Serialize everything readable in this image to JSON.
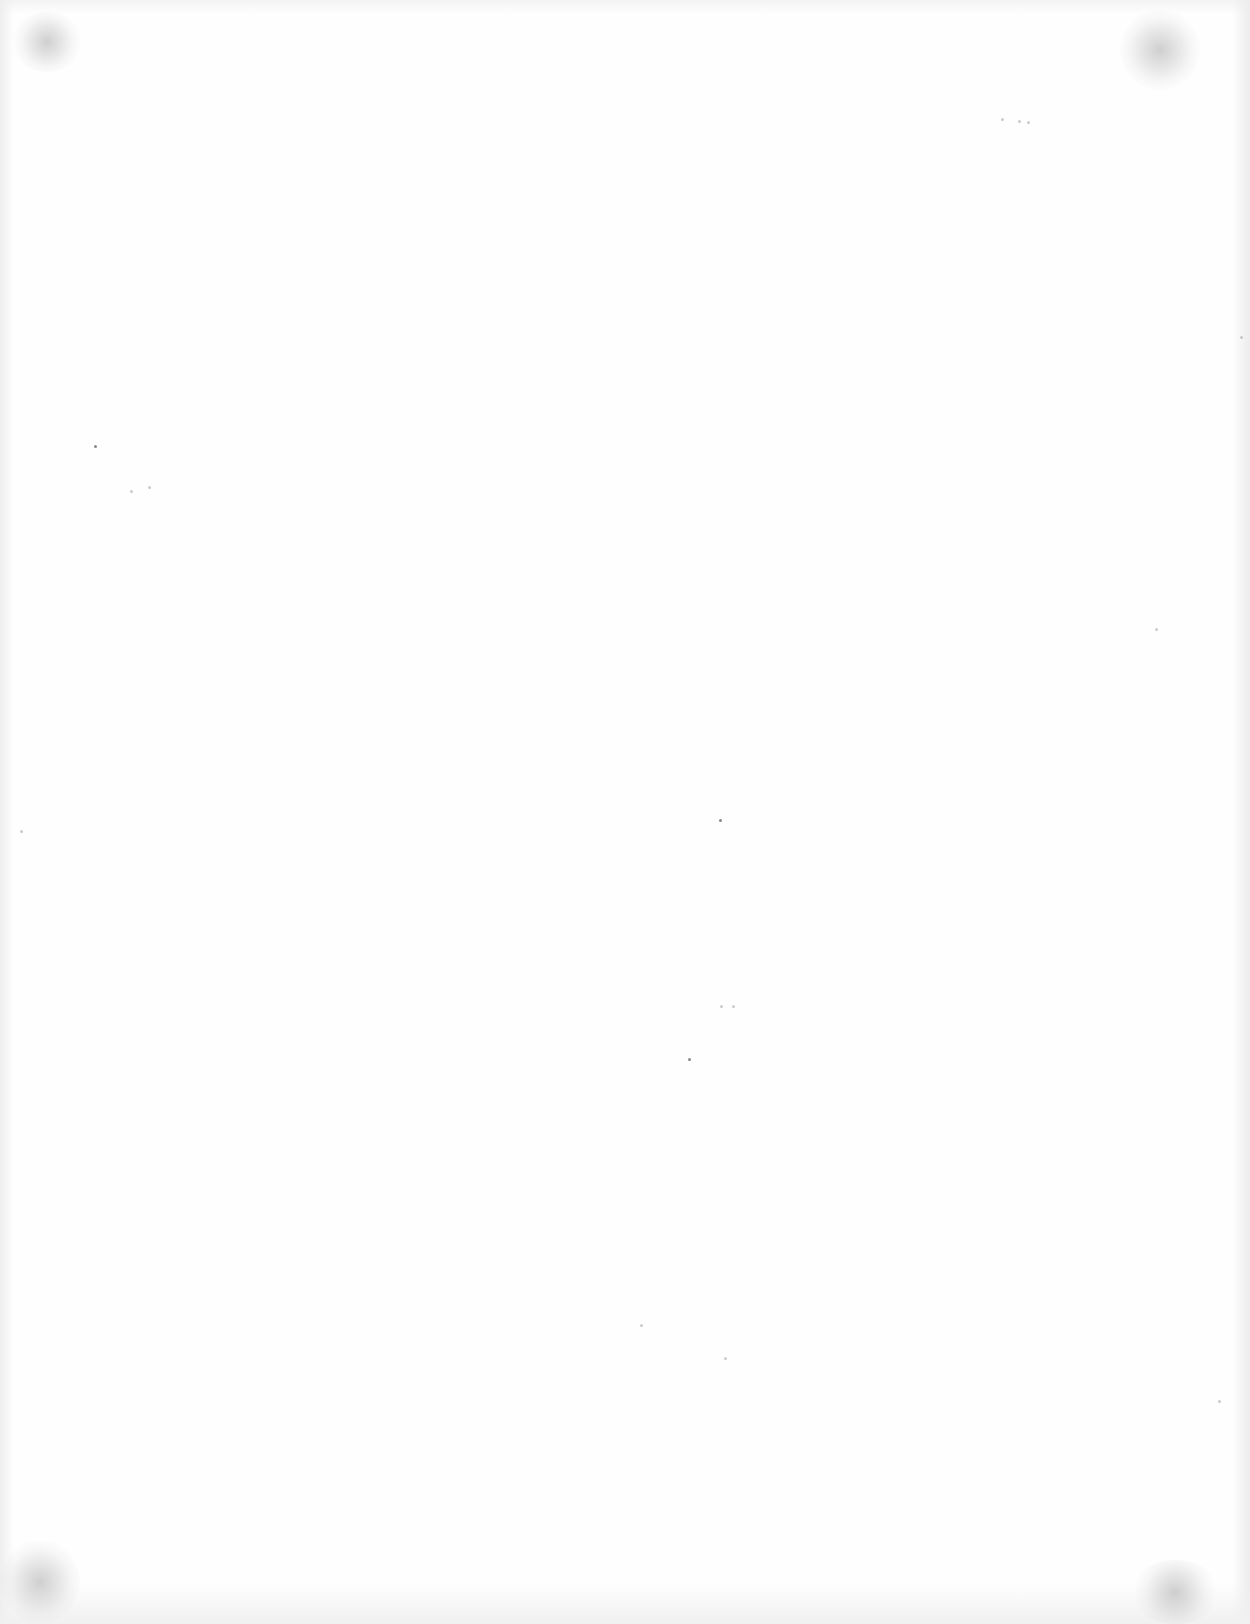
{
  "document": {
    "type": "blank scanned page",
    "content": []
  },
  "colors": {
    "paper": "#fefefe",
    "noise": "#555555"
  }
}
